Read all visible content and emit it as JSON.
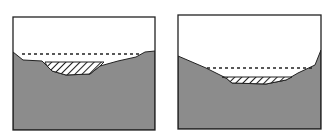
{
  "diagram": {
    "type": "cross-section comparison",
    "colors": {
      "ground": "#8c8c8c",
      "sky": "#ffffff",
      "outline": "#222222",
      "water_line": "#222222",
      "hatch": "#222222"
    },
    "panels": [
      {
        "id": "left",
        "description": "Shallow, wide depression with ground surface; dashed water level line; hatched fill in lowest part",
        "box": [
          13,
          17,
          142,
          113
        ],
        "profile": "13,52 23,60 42,61 47,66 52,71 66,75 90,74 100,66 118,61 136,57 145,52 155,51",
        "dashed_line": {
          "x1": 22,
          "x2": 140,
          "y": 54
        },
        "hatch": "45,62 104,62 100,66 90,74 66,75 52,71 47,66"
      },
      {
        "id": "right",
        "description": "Deeper basin with steep sides; dashed water level line; hatched fill at bottom",
        "box": [
          178,
          15,
          143,
          114
        ],
        "profile": "178,56 206,68 216,73 226,78 232,83 266,84 286,80 298,73 315,65 321,50",
        "dashed_line": {
          "x1": 207,
          "x2": 313,
          "y": 68
        },
        "hatch": "222,77 292,77 286,80 266,84 232,83 226,78"
      }
    ]
  }
}
